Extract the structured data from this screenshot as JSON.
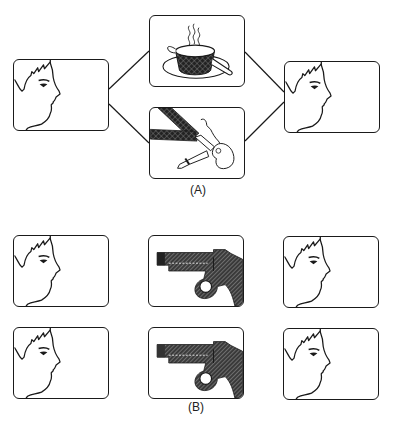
{
  "figure": {
    "panel_a": {
      "caption": "(A)",
      "left_shot": {
        "content": "face-profile"
      },
      "top_middle_shot": {
        "content": "steaming-soup-bowl"
      },
      "bottom_middle_shot": {
        "content": "woman-lying-on-floor"
      },
      "right_shot": {
        "content": "face-profile"
      }
    },
    "panel_b": {
      "caption": "(B)",
      "rows": [
        {
          "left": "face-profile",
          "middle": "revolver",
          "right": "face-profile"
        },
        {
          "left": "face-profile",
          "middle": "revolver",
          "right": "face-profile"
        }
      ]
    },
    "colors": {
      "ink": "#1a1a1a",
      "paper": "#ffffff"
    }
  }
}
